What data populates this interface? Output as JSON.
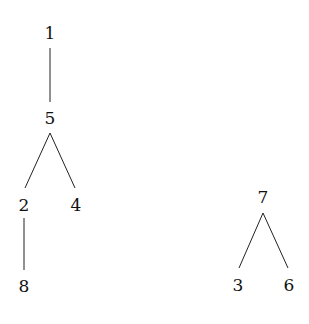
{
  "diagram": {
    "type": "forest",
    "colors": {
      "line": "#222222",
      "text": "#111111",
      "background": "#ffffff"
    },
    "nodes": [
      {
        "id": "1",
        "label": "1",
        "x": 50,
        "y": 33
      },
      {
        "id": "5",
        "label": "5",
        "x": 50,
        "y": 118
      },
      {
        "id": "2",
        "label": "2",
        "x": 24,
        "y": 205
      },
      {
        "id": "4",
        "label": "4",
        "x": 76,
        "y": 205
      },
      {
        "id": "8",
        "label": "8",
        "x": 24,
        "y": 286
      },
      {
        "id": "7",
        "label": "7",
        "x": 263,
        "y": 197
      },
      {
        "id": "3",
        "label": "3",
        "x": 238,
        "y": 285
      },
      {
        "id": "6",
        "label": "6",
        "x": 289,
        "y": 285
      }
    ],
    "edges": [
      {
        "from": "1",
        "to": "5"
      },
      {
        "from": "5",
        "to": "2"
      },
      {
        "from": "5",
        "to": "4"
      },
      {
        "from": "2",
        "to": "8"
      },
      {
        "from": "7",
        "to": "3"
      },
      {
        "from": "7",
        "to": "6"
      }
    ]
  }
}
